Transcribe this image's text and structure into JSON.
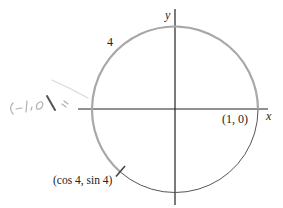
{
  "figure": {
    "type": "unit-circle",
    "center_px": [
      175,
      109.5
    ],
    "radius_px": 83,
    "axes": {
      "x_label": "x",
      "y_label": "y"
    },
    "arc_label": "4",
    "points": {
      "start": {
        "label": "(1, 0)",
        "angle": 0
      },
      "terminal": {
        "label": "(cos 4, sin 4)",
        "angle": 4
      }
    },
    "handwritten_annotation": "(-1,0)",
    "colors": {
      "traversed_arc": "#a8a8a8",
      "remaining_arc": "#555555",
      "axes": "#222222",
      "handwriting": "#b0b0b0"
    }
  }
}
